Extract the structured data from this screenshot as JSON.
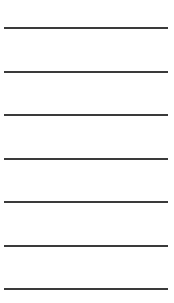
{
  "ruled_lines": {
    "count": 7,
    "line_color": "#3a3a3a",
    "background_color": "#ffffff",
    "lines": [
      {
        "index": 1,
        "y": 27,
        "value": ""
      },
      {
        "index": 2,
        "y": 71,
        "value": ""
      },
      {
        "index": 3,
        "y": 114,
        "value": ""
      },
      {
        "index": 4,
        "y": 158,
        "value": ""
      },
      {
        "index": 5,
        "y": 201,
        "value": ""
      },
      {
        "index": 6,
        "y": 245,
        "value": ""
      },
      {
        "index": 7,
        "y": 288,
        "value": ""
      }
    ]
  }
}
